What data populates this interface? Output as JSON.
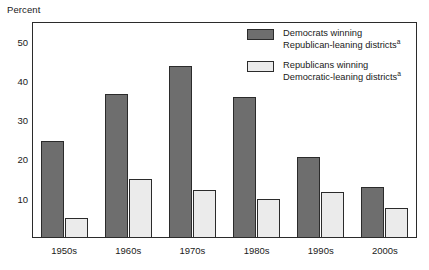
{
  "axis_title": "Percent",
  "legend": {
    "position": "top-right-inside",
    "entries": [
      {
        "swatch": "dark-gray-swatch",
        "line1": "Democrats winning",
        "line2": "Republican-leaning districts",
        "footnote_marker": "a",
        "color": "#6e6e6e"
      },
      {
        "swatch": "light-gray-swatch",
        "line1": "Republicans winning",
        "line2": "Democratic-leaning districts",
        "footnote_marker": "a",
        "color": "#ebebeb"
      }
    ]
  },
  "chart_data": {
    "type": "bar",
    "title": "",
    "subtitle": "",
    "xlabel": "",
    "ylabel": "Percent",
    "ylim": [
      0,
      55
    ],
    "yticks": [
      10,
      20,
      30,
      40,
      50
    ],
    "ytick_labels": [
      "10",
      "20",
      "30",
      "40",
      "50"
    ],
    "grid": false,
    "categories": [
      "1950s",
      "1960s",
      "1970s",
      "1980s",
      "1990s",
      "2000s"
    ],
    "series": [
      {
        "name": "Democrats winning Republican-leaning districts",
        "color": "#6e6e6e",
        "values": [
          24.7,
          36.7,
          43.8,
          35.8,
          20.7,
          12.9
        ]
      },
      {
        "name": "Republicans winning Democratic-leaning districts",
        "color": "#ebebeb",
        "values": [
          5.0,
          14.9,
          12.2,
          10.0,
          11.8,
          7.6
        ]
      }
    ],
    "annotations": []
  }
}
